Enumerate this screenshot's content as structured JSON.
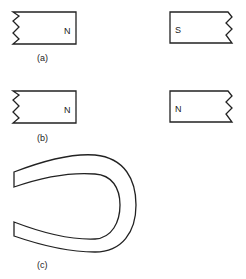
{
  "figure": {
    "panels": [
      {
        "label": "(a)",
        "magnets": [
          {
            "position": "left",
            "pole_label": "N",
            "broken_edge": "left"
          },
          {
            "position": "right",
            "pole_label": "S",
            "broken_edge": "right"
          }
        ]
      },
      {
        "label": "(b)",
        "magnets": [
          {
            "position": "left",
            "pole_label": "N",
            "broken_edge": "left"
          },
          {
            "position": "right",
            "pole_label": "N",
            "broken_edge": "right"
          }
        ]
      },
      {
        "label": "(c)",
        "shape": "horseshoe-magnet"
      }
    ]
  }
}
